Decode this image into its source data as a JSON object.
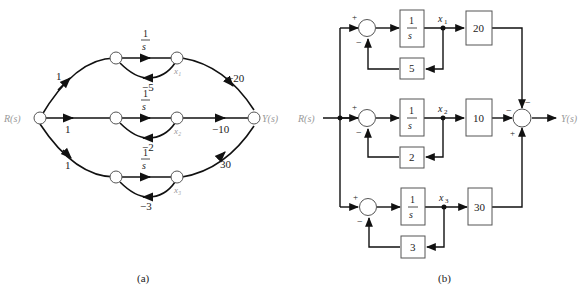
{
  "panel_a": {
    "caption": "(a)",
    "input_label": "R(s)",
    "output_label": "Y(s)",
    "branches": [
      {
        "input_gain": "1",
        "forward": {
          "num": "1",
          "den": "s"
        },
        "feedback": "−5",
        "state": "x₁",
        "output_gain": "−20"
      },
      {
        "input_gain": "1",
        "forward": {
          "num": "1",
          "den": "s"
        },
        "feedback": "−2",
        "state": "x₂",
        "output_gain": "−10"
      },
      {
        "input_gain": "1",
        "forward": {
          "num": "1",
          "den": "s"
        },
        "feedback": "−3",
        "state": "x₃",
        "output_gain": "30"
      }
    ]
  },
  "panel_b": {
    "caption": "(b)",
    "input_label": "R(s)",
    "output_label": "Y(s)",
    "branches": [
      {
        "integrator": {
          "num": "1",
          "den": "s"
        },
        "state": "x",
        "state_sub": "1",
        "feedback_gain": "5",
        "output_gain": "20",
        "plus": "+",
        "minus": "−"
      },
      {
        "integrator": {
          "num": "1",
          "den": "s"
        },
        "state": "x",
        "state_sub": "2",
        "feedback_gain": "2",
        "output_gain": "10",
        "plus": "+",
        "minus": "−"
      },
      {
        "integrator": {
          "num": "1",
          "den": "s"
        },
        "state": "x",
        "state_sub": "3",
        "feedback_gain": "3",
        "output_gain": "30",
        "plus": "+",
        "minus": "−"
      }
    ],
    "output_sum_signs": {
      "top": "−",
      "left": "−",
      "bottom": "+"
    }
  }
}
